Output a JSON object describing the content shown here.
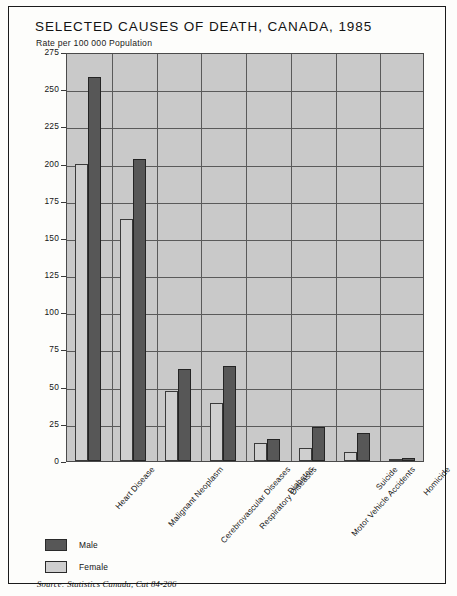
{
  "chart_data": {
    "type": "bar",
    "title": "SELECTED CAUSES OF DEATH, CANADA, 1985",
    "subtitle": "Rate per 100 000 Population",
    "ylabel": "Rate per 100 000 Population",
    "xlabel": "",
    "ylim": [
      0,
      275
    ],
    "yticks": [
      0,
      25,
      50,
      75,
      100,
      125,
      150,
      175,
      200,
      225,
      250,
      275
    ],
    "grid": true,
    "legend_position": "below-plot-left",
    "categories": [
      "Heart Disease",
      "Malignant Neoplasm",
      "Cerebrovascular Diseases",
      "Respiratory Diseases",
      "Diabetes",
      "Motor Vehicle Accidents",
      "Suicide",
      "Homicide"
    ],
    "series": [
      {
        "name": "Male",
        "color": "#575757",
        "values": [
          258,
          203,
          62,
          64,
          15,
          23,
          19,
          2
        ]
      },
      {
        "name": "Female",
        "color": "#cfcfcf",
        "values": [
          200,
          163,
          47,
          39,
          12,
          9,
          6,
          1
        ]
      }
    ],
    "source": "Source: Statistics Canada, Cat 84-206"
  },
  "legend": {
    "items": [
      {
        "label": "Male",
        "key": "male"
      },
      {
        "label": "Female",
        "key": "female"
      }
    ]
  }
}
